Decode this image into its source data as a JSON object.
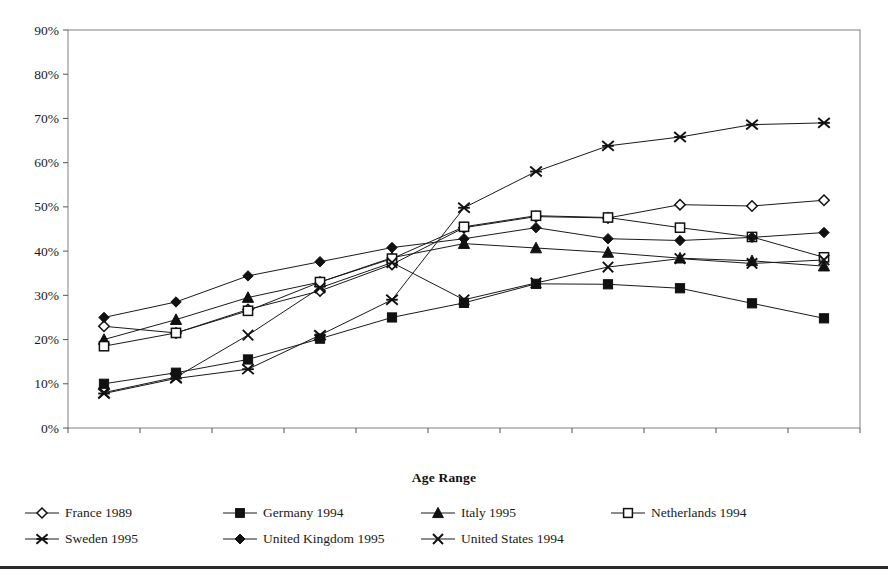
{
  "chart_data": {
    "type": "line",
    "title": "",
    "xlabel": "Age Range",
    "ylabel": "",
    "categories": [
      "18-22",
      "19-23",
      "20-24",
      "21-25",
      "22-26",
      "23-27",
      "24-28",
      "25-29",
      "26-30",
      "27-31",
      "28-32"
    ],
    "ylim": [
      0,
      90
    ],
    "ytick_labels": [
      "0%",
      "10%",
      "20%",
      "30%",
      "40%",
      "50%",
      "60%",
      "70%",
      "80%",
      "90%"
    ],
    "ytick_values": [
      0,
      10,
      20,
      30,
      40,
      50,
      60,
      70,
      80,
      90
    ],
    "grid": false,
    "legend_position": "bottom",
    "series": [
      {
        "name": "France 1989",
        "marker": "open-diamond",
        "values": [
          23.0,
          21.5,
          26.8,
          31.0,
          37.0,
          45.3,
          47.8,
          47.5,
          50.5,
          50.2,
          51.5
        ]
      },
      {
        "name": "Germany 1994",
        "marker": "filled-square",
        "values": [
          10.0,
          12.5,
          15.5,
          20.2,
          25.0,
          28.3,
          32.6,
          32.5,
          31.6,
          28.2,
          24.8
        ]
      },
      {
        "name": "Italy 1995",
        "marker": "filled-triangle",
        "values": [
          20.0,
          24.5,
          29.5,
          33.0,
          38.5,
          41.7,
          40.7,
          39.7,
          38.4,
          37.8,
          36.6
        ]
      },
      {
        "name": "Netherlands 1994",
        "marker": "open-square",
        "values": [
          18.5,
          21.5,
          26.5,
          33.0,
          38.3,
          45.5,
          48.0,
          47.6,
          45.3,
          43.2,
          38.6
        ]
      },
      {
        "name": "Sweden 1995",
        "marker": "star",
        "values": [
          7.8,
          11.2,
          13.3,
          21.0,
          29.0,
          49.8,
          58.0,
          63.8,
          65.8,
          68.6,
          69.0
        ]
      },
      {
        "name": "United Kingdom 1995",
        "marker": "filled-diamond",
        "values": [
          25.0,
          28.5,
          34.4,
          37.6,
          40.8,
          42.8,
          45.3,
          42.8,
          42.4,
          43.1,
          44.2
        ]
      },
      {
        "name": "United States 1994",
        "marker": "cross-x",
        "values": [
          8.0,
          11.5,
          21.0,
          31.7,
          37.4,
          29.0,
          32.8,
          36.4,
          38.3,
          37.2,
          38.0
        ]
      }
    ]
  },
  "axis": {
    "x_title": "Age Range"
  },
  "legend": {
    "items": [
      {
        "label": "France 1989",
        "marker": "open-diamond"
      },
      {
        "label": "Germany 1994",
        "marker": "filled-square"
      },
      {
        "label": "Italy 1995",
        "marker": "filled-triangle"
      },
      {
        "label": "Netherlands 1994",
        "marker": "open-square"
      },
      {
        "label": "Sweden 1995",
        "marker": "star"
      },
      {
        "label": "United Kingdom 1995",
        "marker": "filled-diamond"
      },
      {
        "label": "United States 1994",
        "marker": "cross-x"
      }
    ]
  },
  "colors": {
    "line": "#1a1a1a",
    "frame": "#7a7a7a",
    "text": "#1a1a1a",
    "rule": "#2b2b2b"
  }
}
